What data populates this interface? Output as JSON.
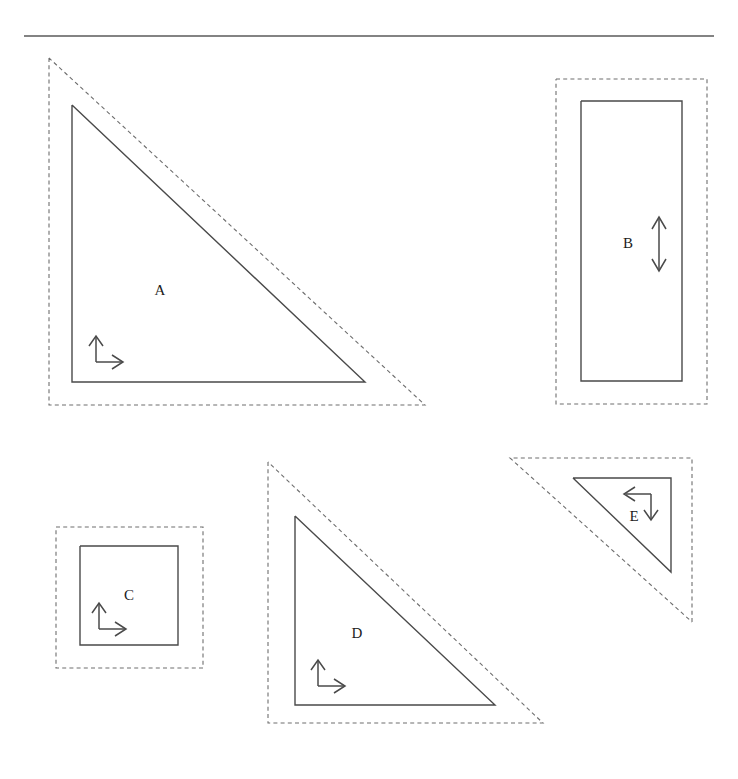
{
  "figure": {
    "title": "",
    "background_color": "#ffffff",
    "solid_stroke_color": "#4a4a4a",
    "dashed_stroke_color": "#6e6e6e",
    "label_color": "#1c1c1c",
    "canvas": {
      "width": 738,
      "height": 779
    },
    "header_rule": {
      "x1": 24,
      "y1": 36,
      "x2": 714,
      "y2": 36
    },
    "shapes": [
      {
        "id": "A",
        "label": "A",
        "kind": "right-triangle",
        "orientation": "right-angle-bottom-left",
        "label_pos": {
          "x": 160,
          "y": 292
        },
        "solid_points": "72,105 72,382 365,382 72,105",
        "dashed_points": "49,58 49,405 425,405 49,58",
        "axis_marker": {
          "type": "l-axis-up-right",
          "origin": {
            "x": 96,
            "y": 362
          },
          "up_tip": {
            "x": 96,
            "y": 337
          },
          "right_tip": {
            "x": 122,
            "y": 362
          },
          "rotation_deg": 0
        }
      },
      {
        "id": "B",
        "label": "B",
        "kind": "rectangle",
        "orientation": "upright",
        "label_pos": {
          "x": 628,
          "y": 245
        },
        "solid_points": "581,101 682,101 682,381 581,381 581,101",
        "dashed_points": "556,79 707,79 707,404 556,404 556,79",
        "axis_marker": {
          "type": "double-headed-vertical-arrow",
          "top": {
            "x": 659,
            "y": 218
          },
          "bottom": {
            "x": 659,
            "y": 270
          }
        }
      },
      {
        "id": "C",
        "label": "C",
        "kind": "square",
        "orientation": "upright",
        "label_pos": {
          "x": 129,
          "y": 597
        },
        "solid_points": "80,546 178,546 178,645 80,645 80,546",
        "dashed_points": "56,527 203,527 203,668 56,668 56,527",
        "axis_marker": {
          "type": "l-axis-up-right",
          "origin": {
            "x": 99,
            "y": 629
          },
          "up_tip": {
            "x": 99,
            "y": 604
          },
          "right_tip": {
            "x": 125,
            "y": 629
          },
          "rotation_deg": 0
        }
      },
      {
        "id": "D",
        "label": "D",
        "kind": "right-triangle",
        "orientation": "right-angle-bottom-left",
        "label_pos": {
          "x": 357,
          "y": 635
        },
        "solid_points": "295,516 295,705 495,705 295,516",
        "dashed_points": "268,462 268,723 543,723 268,462",
        "axis_marker": {
          "type": "l-axis-up-right",
          "origin": {
            "x": 318,
            "y": 686
          },
          "up_tip": {
            "x": 318,
            "y": 661
          },
          "right_tip": {
            "x": 344,
            "y": 686
          },
          "rotation_deg": 0
        }
      },
      {
        "id": "E",
        "label": "E",
        "kind": "right-triangle",
        "orientation": "right-angle-top-right-rotated-180",
        "label_pos": {
          "x": 634,
          "y": 518
        },
        "solid_points": "573,478 671,478 671,572 573,478",
        "dashed_points": "692,622 692,458 510,458 692,622",
        "axis_marker": {
          "type": "l-axis-left-down",
          "origin": {
            "x": 651,
            "y": 494
          },
          "left_tip": {
            "x": 625,
            "y": 494
          },
          "down_tip": {
            "x": 651,
            "y": 519
          },
          "rotation_deg": 180
        }
      }
    ]
  }
}
